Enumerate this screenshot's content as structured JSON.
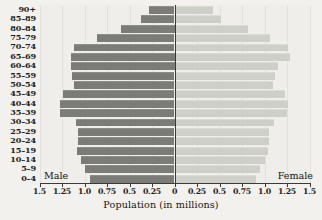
{
  "chart_data": {
    "type": "bar",
    "subtype": "population-pyramid",
    "title": "",
    "xlabel": "Population (in millions)",
    "ylabel": "",
    "categories": [
      "0–4",
      "5–9",
      "10–14",
      "15–19",
      "20–24",
      "25–29",
      "30–34",
      "35–39",
      "40–44",
      "45–49",
      "50–54",
      "55–59",
      "60–64",
      "65–69",
      "70–74",
      "75–79",
      "80–84",
      "85–89",
      "90+"
    ],
    "series": [
      {
        "name": "Male",
        "side": "left",
        "color": "#7b7b78",
        "values": [
          0.94,
          0.99,
          1.04,
          1.08,
          1.07,
          1.07,
          1.1,
          1.27,
          1.27,
          1.24,
          1.12,
          1.14,
          1.15,
          1.15,
          1.12,
          0.86,
          0.6,
          0.37,
          0.28
        ]
      },
      {
        "name": "Female",
        "side": "right",
        "color": "#cfcfca",
        "values": [
          0.89,
          0.94,
          0.99,
          1.03,
          1.04,
          1.04,
          1.09,
          1.24,
          1.25,
          1.22,
          1.08,
          1.1,
          1.14,
          1.27,
          1.25,
          1.05,
          0.8,
          0.5,
          0.42
        ]
      }
    ],
    "xlim": [
      -1.5,
      1.5
    ],
    "x_ticks": [
      1.5,
      1.25,
      1.0,
      0.75,
      0.5,
      0.25,
      0,
      0.25,
      0.5,
      0.75,
      1.0,
      1.25,
      1.5
    ],
    "x_tick_labels": [
      "1.5",
      "1.25",
      "1.0",
      "0.75",
      "0.5",
      "0.25",
      "0",
      "0.25",
      "0.5",
      "0.75",
      "1.0",
      "1.25",
      "1.5"
    ],
    "grid": false,
    "legend_position": "in-plot-bottom-corners",
    "annotations": [
      {
        "text": "Male",
        "position": "bottom-left-inside-plot"
      },
      {
        "text": "Female",
        "position": "bottom-right-inside-plot"
      }
    ]
  },
  "labels": {
    "male": "Male",
    "female": "Female",
    "x_axis_title": "Population (in millions)"
  }
}
